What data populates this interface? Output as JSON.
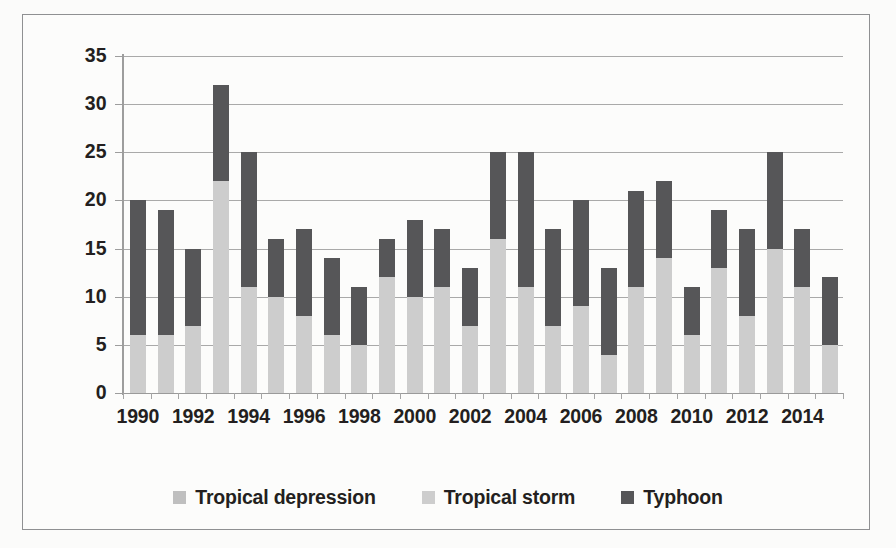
{
  "chart_data": {
    "type": "bar",
    "stacked": true,
    "title": "",
    "xlabel": "",
    "ylabel": "",
    "ylim": [
      0,
      35
    ],
    "ytick_step": 5,
    "yticks": [
      0,
      5,
      10,
      15,
      20,
      25,
      30,
      35
    ],
    "grid": true,
    "legend_position": "bottom",
    "x": [
      1990,
      1991,
      1992,
      1993,
      1994,
      1995,
      1996,
      1997,
      1998,
      1999,
      2000,
      2001,
      2002,
      2003,
      2004,
      2005,
      2006,
      2007,
      2008,
      2009,
      2010,
      2011,
      2012,
      2013,
      2014,
      2015
    ],
    "xtick_labels": [
      "1990",
      "1992",
      "1994",
      "1996",
      "1998",
      "2000",
      "2002",
      "2004",
      "2014"
    ],
    "xticks_shown": [
      1990,
      1992,
      1994,
      1996,
      1998,
      2000,
      2002,
      2004,
      2006,
      2008,
      2010,
      2012,
      2014
    ],
    "series": [
      {
        "name": "Tropical depression",
        "color": "#bfbfbf",
        "values": [
          0,
          0,
          0,
          0,
          0,
          0,
          0,
          0,
          0,
          0,
          0,
          0,
          0,
          0,
          0,
          0,
          0,
          0,
          0,
          0,
          0,
          0,
          0,
          0,
          0,
          0
        ]
      },
      {
        "name": "Tropical storm",
        "color": "#cdcdcd",
        "values": [
          6,
          6,
          7,
          22,
          11,
          10,
          8,
          6,
          5,
          12,
          10,
          11,
          7,
          16,
          11,
          7,
          9,
          4,
          11,
          14,
          6,
          13,
          8,
          15,
          11,
          5
        ]
      },
      {
        "name": "Typhoon",
        "color": "#565658",
        "values": [
          14,
          13,
          8,
          10,
          14,
          6,
          9,
          8,
          6,
          4,
          8,
          6,
          6,
          9,
          14,
          10,
          11,
          9,
          10,
          8,
          5,
          6,
          9,
          10,
          6,
          7
        ]
      }
    ],
    "totals": [
      20,
      19,
      15,
      32,
      25,
      16,
      17,
      14,
      11,
      16,
      18,
      17,
      13,
      25,
      25,
      17,
      20,
      13,
      21,
      22,
      11,
      19,
      17,
      25,
      17,
      12
    ]
  },
  "legend": {
    "items": [
      {
        "label": "Tropical depression",
        "color": "#bfbfbf"
      },
      {
        "label": "Tropical storm",
        "color": "#cdcdcd"
      },
      {
        "label": "Typhoon",
        "color": "#565658"
      }
    ]
  },
  "axis": {
    "y_labels": [
      "35",
      "30",
      "25",
      "20",
      "15",
      "10",
      "5",
      "0"
    ],
    "x_labels": [
      "1990",
      "1992",
      "1994",
      "1996",
      "1998",
      "2000",
      "2002",
      "2004",
      "2006",
      "2008",
      "2010",
      "2012",
      "2014"
    ]
  },
  "colors": {
    "frame": "#8f9092",
    "gridline": "#a9a9a9",
    "axis": "#9d9d9d",
    "text": "#231f20",
    "background": "#fcfcfb"
  }
}
